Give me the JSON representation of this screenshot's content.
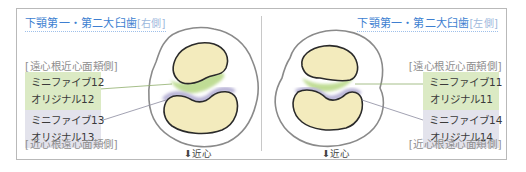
{
  "left_panel": {
    "title": "下顎第一・第二大臼歯",
    "side": "[右側]",
    "upper_bracket": "[遠心根近心面頬側]",
    "upper_box": {
      "line1": "ミニファイブ12",
      "line2": "オリジナル12"
    },
    "lower_box": {
      "line1": "ミニファイブ13",
      "line2": "オリジナル13"
    },
    "lower_bracket": "[近心根遠心面頬側]",
    "direction": "⬇近心"
  },
  "right_panel": {
    "title": "下顎第一・第二大臼歯",
    "side": "[左側]",
    "upper_bracket": "[遠心根近心面頬側]",
    "upper_box": {
      "line1": "ミニファイブ11",
      "line2": "オリジナル11"
    },
    "lower_box": {
      "line1": "ミニファイブ14",
      "line2": "オリジナル14"
    },
    "lower_bracket": "[近心根遠心面頬側]",
    "direction": "⬇近心"
  },
  "colors": {
    "title": "#3e7fd1",
    "green_box": "#dbeac4",
    "gray_box": "#e3e3ec",
    "root_fill": "#f3ebbd",
    "green_highlight": "#b9d98a",
    "purple_highlight": "#b8b3d6"
  }
}
